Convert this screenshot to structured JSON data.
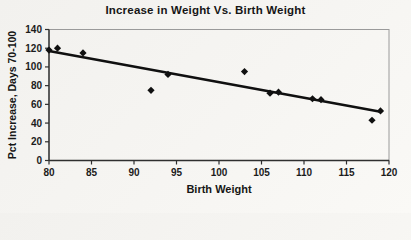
{
  "chart_data": {
    "type": "scatter",
    "title": "Increase in Weight Vs. Birth Weight",
    "xlabel": "Birth Weight",
    "ylabel": "Pct Increase, Days 70-100",
    "xlim": [
      80,
      120
    ],
    "ylim": [
      0,
      140
    ],
    "xticks": [
      80,
      85,
      90,
      95,
      100,
      105,
      110,
      115,
      120
    ],
    "yticks": [
      0,
      20,
      40,
      60,
      80,
      100,
      120,
      140
    ],
    "grid": false,
    "legend": false,
    "marker": "diamond",
    "points": [
      [
        80,
        118
      ],
      [
        81,
        120
      ],
      [
        84,
        115
      ],
      [
        92,
        75
      ],
      [
        94,
        92
      ],
      [
        103,
        95
      ],
      [
        106,
        72
      ],
      [
        107,
        73
      ],
      [
        111,
        66
      ],
      [
        112,
        65
      ],
      [
        118,
        43
      ],
      [
        119,
        53
      ]
    ],
    "trendline": {
      "x1": 80,
      "y1": 117,
      "x2": 119,
      "y2": 52
    },
    "colors": {
      "background": "#f4f3f0",
      "plot_border": "#9a9a9a",
      "axis": "#2f2f2f",
      "marker": "#101010",
      "trend": "#101010",
      "text": "#161616"
    }
  }
}
